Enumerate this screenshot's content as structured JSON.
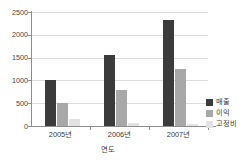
{
  "chart_data": {
    "type": "bar",
    "title": "",
    "xlabel": "연도",
    "ylabel": "",
    "categories": [
      "2005년",
      "2006년",
      "2007년"
    ],
    "series": [
      {
        "name": "매출",
        "color": "#3b3b3b",
        "values": [
          1000,
          1550,
          2320
        ]
      },
      {
        "name": "이익",
        "color": "#a8a8a8",
        "values": [
          500,
          800,
          1250
        ]
      },
      {
        "name": "고정비",
        "color": "#e2e2e2",
        "values": [
          150,
          60,
          40
        ]
      }
    ],
    "ylim": [
      0,
      2500
    ],
    "yticks": [
      0,
      500,
      1000,
      1500,
      2000,
      2500
    ],
    "ytick_labels": [
      "0",
      "500",
      "1000",
      "1500",
      "2000",
      "2500"
    ],
    "grid": true,
    "legend_position": "right"
  },
  "legend": {
    "items": [
      {
        "label": "매출"
      },
      {
        "label": "이익"
      },
      {
        "label": "고정비"
      }
    ]
  },
  "axes": {
    "x_title": "연도"
  }
}
